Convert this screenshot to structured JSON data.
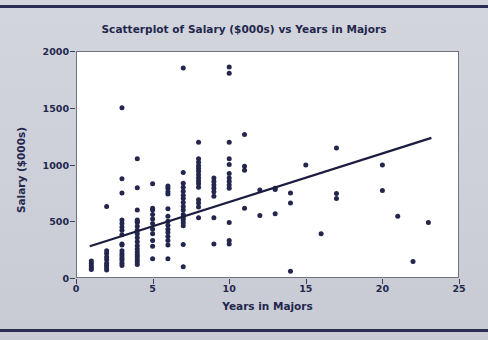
{
  "figure": {
    "background_color": "#cfd2da",
    "rule_color": "#2b2d55"
  },
  "chart_data": {
    "type": "scatter",
    "title": "Scatterplot of Salary ($000s) vs Years in Majors",
    "xlabel": "Years in Majors",
    "ylabel": "Salary ($000s)",
    "xlim": [
      0,
      25
    ],
    "ylim": [
      0,
      2000
    ],
    "xticks": [
      0,
      5,
      10,
      15,
      20,
      25
    ],
    "yticks": [
      0,
      500,
      1000,
      1500,
      2000
    ],
    "grid": false,
    "legend": null,
    "marker_color": "#23264d",
    "marker_size": 5,
    "trendline": {
      "type": "linear-fit",
      "color": "#1b1d3f",
      "x_start": 0.9,
      "y_start": 280,
      "x_end": 23.2,
      "y_end": 1235
    },
    "points": [
      [
        1,
        90
      ],
      [
        1,
        110
      ],
      [
        1,
        130
      ],
      [
        1,
        150
      ],
      [
        1,
        75
      ],
      [
        2,
        70
      ],
      [
        2,
        90
      ],
      [
        2,
        110
      ],
      [
        2,
        130
      ],
      [
        2,
        160
      ],
      [
        2,
        185
      ],
      [
        2,
        215
      ],
      [
        2,
        240
      ],
      [
        2,
        630
      ],
      [
        3,
        110
      ],
      [
        3,
        130
      ],
      [
        3,
        155
      ],
      [
        3,
        175
      ],
      [
        3,
        195
      ],
      [
        3,
        215
      ],
      [
        3,
        240
      ],
      [
        3,
        290
      ],
      [
        3,
        300
      ],
      [
        3,
        380
      ],
      [
        3,
        420
      ],
      [
        3,
        450
      ],
      [
        3,
        480
      ],
      [
        3,
        510
      ],
      [
        3,
        750
      ],
      [
        3,
        875
      ],
      [
        3,
        1500
      ],
      [
        4,
        120
      ],
      [
        4,
        140
      ],
      [
        4,
        160
      ],
      [
        4,
        185
      ],
      [
        4,
        205
      ],
      [
        4,
        230
      ],
      [
        4,
        255
      ],
      [
        4,
        285
      ],
      [
        4,
        320
      ],
      [
        4,
        355
      ],
      [
        4,
        390
      ],
      [
        4,
        420
      ],
      [
        4,
        455
      ],
      [
        4,
        490
      ],
      [
        4,
        500
      ],
      [
        4,
        510
      ],
      [
        4,
        600
      ],
      [
        4,
        795
      ],
      [
        4,
        1050
      ],
      [
        5,
        170
      ],
      [
        5,
        280
      ],
      [
        5,
        330
      ],
      [
        5,
        390
      ],
      [
        5,
        430
      ],
      [
        5,
        480
      ],
      [
        5,
        520
      ],
      [
        5,
        560
      ],
      [
        5,
        600
      ],
      [
        5,
        615
      ],
      [
        5,
        830
      ],
      [
        6,
        170
      ],
      [
        6,
        290
      ],
      [
        6,
        330
      ],
      [
        6,
        365
      ],
      [
        6,
        400
      ],
      [
        6,
        430
      ],
      [
        6,
        465
      ],
      [
        6,
        500
      ],
      [
        6,
        545
      ],
      [
        6,
        610
      ],
      [
        6,
        740
      ],
      [
        6,
        760
      ],
      [
        6,
        790
      ],
      [
        6,
        810
      ],
      [
        7,
        100
      ],
      [
        7,
        295
      ],
      [
        7,
        460
      ],
      [
        7,
        490
      ],
      [
        7,
        515
      ],
      [
        7,
        530
      ],
      [
        7,
        560
      ],
      [
        7,
        600
      ],
      [
        7,
        630
      ],
      [
        7,
        665
      ],
      [
        7,
        700
      ],
      [
        7,
        730
      ],
      [
        7,
        765
      ],
      [
        7,
        800
      ],
      [
        7,
        835
      ],
      [
        7,
        930
      ],
      [
        7,
        1850
      ],
      [
        8,
        530
      ],
      [
        8,
        625
      ],
      [
        8,
        660
      ],
      [
        8,
        690
      ],
      [
        8,
        800
      ],
      [
        8,
        830
      ],
      [
        8,
        855
      ],
      [
        8,
        880
      ],
      [
        8,
        910
      ],
      [
        8,
        940
      ],
      [
        8,
        965
      ],
      [
        8,
        990
      ],
      [
        8,
        1020
      ],
      [
        8,
        1050
      ],
      [
        8,
        1195
      ],
      [
        9,
        300
      ],
      [
        9,
        530
      ],
      [
        9,
        720
      ],
      [
        9,
        760
      ],
      [
        9,
        790
      ],
      [
        9,
        820
      ],
      [
        9,
        850
      ],
      [
        9,
        880
      ],
      [
        10,
        300
      ],
      [
        10,
        330
      ],
      [
        10,
        490
      ],
      [
        10,
        790
      ],
      [
        10,
        820
      ],
      [
        10,
        850
      ],
      [
        10,
        880
      ],
      [
        10,
        920
      ],
      [
        10,
        1000
      ],
      [
        10,
        1050
      ],
      [
        10,
        1195
      ],
      [
        10,
        1805
      ],
      [
        10,
        1860
      ],
      [
        11,
        615
      ],
      [
        11,
        950
      ],
      [
        11,
        985
      ],
      [
        11,
        1265
      ],
      [
        12,
        550
      ],
      [
        12,
        775
      ],
      [
        13,
        565
      ],
      [
        13,
        780
      ],
      [
        13,
        790
      ],
      [
        14,
        60
      ],
      [
        14,
        660
      ],
      [
        14,
        750
      ],
      [
        15,
        995
      ],
      [
        16,
        390
      ],
      [
        17,
        700
      ],
      [
        17,
        745
      ],
      [
        17,
        1145
      ],
      [
        20,
        770
      ],
      [
        20,
        995
      ],
      [
        21,
        545
      ],
      [
        22,
        145
      ],
      [
        23,
        490
      ]
    ]
  }
}
